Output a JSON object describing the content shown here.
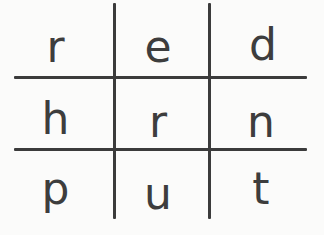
{
  "worksheet": {
    "kind": "three-by-three letter grid",
    "colors": {
      "background": "#fbfbfa",
      "stroke": "#3b3b3b",
      "glyph": "#3d3d3d"
    },
    "rows": [
      {
        "row_text": "red",
        "cells": [
          {
            "letter": "r"
          },
          {
            "letter": "e"
          },
          {
            "letter": "d"
          }
        ]
      },
      {
        "row_text": "hrn",
        "cells": [
          {
            "letter": "h"
          },
          {
            "letter": "r"
          },
          {
            "letter": "n"
          }
        ]
      },
      {
        "row_text": "put",
        "cells": [
          {
            "letter": "p"
          },
          {
            "letter": "u"
          },
          {
            "letter": "t"
          }
        ]
      }
    ]
  }
}
